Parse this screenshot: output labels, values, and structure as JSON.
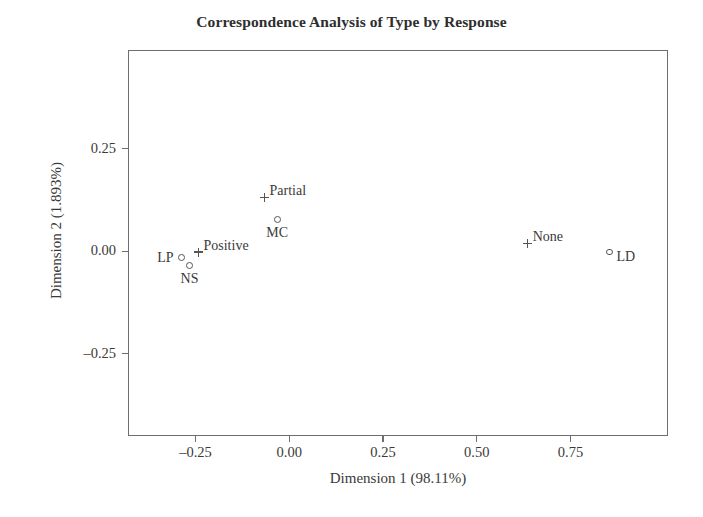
{
  "chart_data": {
    "type": "scatter",
    "title": "Correspondence Analysis of Type by Response",
    "xlabel": "Dimension 1 (98.11%)",
    "ylabel": "Dimension 2 (1.893%)",
    "xlim": [
      -0.43,
      1.01
    ],
    "ylim": [
      -0.45,
      0.49
    ],
    "xticks": [
      -0.25,
      0.0,
      0.25,
      0.5,
      0.75
    ],
    "xticklabels": [
      "–0.25",
      "0.00",
      "0.25",
      "0.50",
      "0.75"
    ],
    "yticks": [
      0.25,
      0.0,
      -0.25
    ],
    "yticklabels": [
      "0.25",
      "0.00",
      "–0.25"
    ],
    "grid": false,
    "legend": false,
    "series": [
      {
        "name": "Type",
        "marker": "circle",
        "points": [
          {
            "label": "LP",
            "x": -0.287,
            "y": -0.015,
            "label_pos": "left"
          },
          {
            "label": "NS",
            "x": -0.266,
            "y": -0.034,
            "label_pos": "below"
          },
          {
            "label": "MC",
            "x": -0.032,
            "y": 0.078,
            "label_pos": "below"
          },
          {
            "label": "LD",
            "x": 0.854,
            "y": -0.002,
            "label_pos": "right"
          }
        ]
      },
      {
        "name": "Response",
        "marker": "plus",
        "points": [
          {
            "label": "Positive",
            "x": -0.242,
            "y": -0.002,
            "label_pos": "right-up"
          },
          {
            "label": "Partial",
            "x": -0.066,
            "y": 0.131,
            "label_pos": "right-up"
          },
          {
            "label": "None",
            "x": 0.636,
            "y": 0.019,
            "label_pos": "right-up"
          }
        ]
      }
    ]
  },
  "style": {
    "frame_color": "#6e6e6e",
    "text_color": "#3a3a3a",
    "marker_color": "#555555",
    "background": "#ffffff"
  }
}
